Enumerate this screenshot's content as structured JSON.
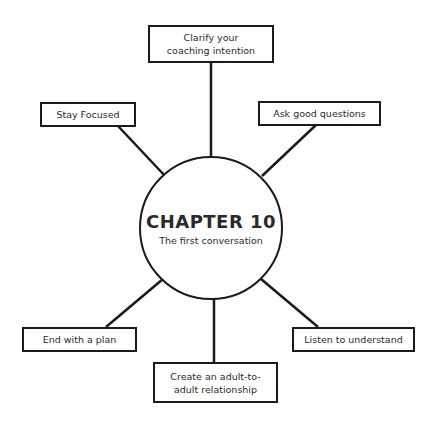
{
  "center": {
    "title": "CHAPTER 10",
    "subtitle": "The first conversation"
  },
  "nodes": [
    {
      "id": "top",
      "label": "Clarify your coaching intention"
    },
    {
      "id": "upper-left",
      "label": "Stay Focused"
    },
    {
      "id": "upper-right",
      "label": "Ask good questions"
    },
    {
      "id": "lower-left",
      "label": "End with a plan"
    },
    {
      "id": "lower-right",
      "label": "Listen to understand"
    },
    {
      "id": "bottom",
      "label": "Create an adult-to-adult relationship"
    }
  ],
  "colors": {
    "stroke": "#1a1a1a",
    "text": "#2a2a2a",
    "background": "#ffffff"
  }
}
